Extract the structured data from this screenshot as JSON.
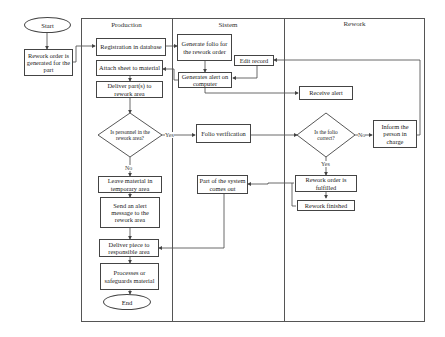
{
  "lanes": {
    "production": "Production",
    "system": "Sistem",
    "rework": "Rework"
  },
  "nodes": {
    "start": "Start",
    "rework_order": "Rework order is generated for the part",
    "registration": "Registration in database",
    "attach_sheet": "Attach sheet to material",
    "deliver_parts": "Deliver part(s) to rework area",
    "personnel_decision": "Is personnel in the rework area?",
    "leave_material": "Leave material in temporary area",
    "send_alert": "Send an alert message to the rework area",
    "deliver_piece": "Deliver piece to responsible area",
    "processes": "Processes or safeguards material",
    "end": "End",
    "generate_folio": "Generate folio for the rework order",
    "edit_record": "Edit record",
    "generates_alert": "Generates alert on computer",
    "folio_verification": "Folio verification",
    "part_comes_out": "Part of the system comes out",
    "receive_alert": "Receive alert",
    "folio_decision": "Is the folio correct?",
    "inform_person": "Inform the person in charge",
    "order_fulfilled": "Rework order is fulfilled",
    "rework_finished": "Rework finished"
  },
  "edge_labels": {
    "personnel_yes": "Yes",
    "personnel_no": "No",
    "folio_yes": "Yes",
    "folio_no": "No"
  },
  "colors": {
    "line": "#444444",
    "frame": "#555555",
    "background": "#ffffff"
  }
}
